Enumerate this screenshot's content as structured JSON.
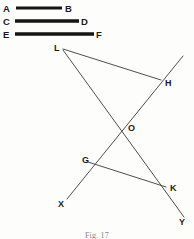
{
  "figure": {
    "caption": "Fig. 17",
    "stroke_color": "#3a3a3a",
    "bar_color": "#151515",
    "label_color": "#1a1a1a",
    "background": "#fdfdfb",
    "width": 194,
    "height": 239
  },
  "segments": [
    {
      "name": "segment-ab",
      "start_label": "A",
      "end_label": "B",
      "x1": 16,
      "x2": 62,
      "y": 8,
      "thickness": 3.2,
      "start_label_x": 3,
      "start_label_y": 12,
      "end_label_x": 65,
      "end_label_y": 12
    },
    {
      "name": "segment-cd",
      "start_label": "C",
      "end_label": "D",
      "x1": 15,
      "x2": 79,
      "y": 21,
      "thickness": 3.4,
      "start_label_x": 3,
      "start_label_y": 25,
      "end_label_x": 81,
      "end_label_y": 25
    },
    {
      "name": "segment-ef",
      "start_label": "E",
      "end_label": "F",
      "x1": 15,
      "x2": 94,
      "y": 34,
      "thickness": 3.6,
      "start_label_x": 3,
      "start_label_y": 38,
      "end_label_x": 96,
      "end_label_y": 38
    }
  ],
  "points": [
    {
      "name": "point-l",
      "label": "L",
      "x": 63,
      "y": 48,
      "label_x": 54,
      "label_y": 51
    },
    {
      "name": "point-h",
      "label": "H",
      "x": 162,
      "y": 81,
      "label_x": 165,
      "label_y": 86
    },
    {
      "name": "point-o",
      "label": "O",
      "x": 124,
      "y": 127,
      "label_x": 128,
      "label_y": 131
    },
    {
      "name": "point-g",
      "label": "G",
      "x": 88,
      "y": 161,
      "label_x": 84,
      "label_y": 163
    },
    {
      "name": "point-k",
      "label": "K",
      "x": 167,
      "y": 188,
      "label_x": 170,
      "label_y": 191
    },
    {
      "name": "point-x",
      "label": "X",
      "x": 67,
      "y": 202,
      "label_x": 58,
      "label_y": 207
    },
    {
      "name": "point-y",
      "label": "Y",
      "x": 184,
      "y": 220,
      "label_x": 180,
      "label_y": 224
    }
  ],
  "lines": [
    {
      "name": "line-l-h",
      "x1": 63,
      "y1": 49,
      "x2": 161,
      "y2": 80
    },
    {
      "name": "line-l-o-k-y",
      "x1": 63,
      "y1": 50,
      "x2": 184,
      "y2": 217
    },
    {
      "name": "line-top-h-o-g-x",
      "x1": 183,
      "y1": 56,
      "x2": 67,
      "y2": 199
    },
    {
      "name": "line-g-k",
      "x1": 88,
      "y1": 162,
      "x2": 166,
      "y2": 187
    }
  ]
}
